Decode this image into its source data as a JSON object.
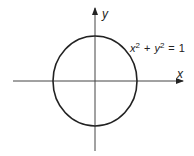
{
  "diagram": {
    "axes": {
      "x_label": "x",
      "y_label": "y"
    },
    "equation": {
      "x_var": "x",
      "x_exp": "2",
      "plus": "+",
      "y_var": "y",
      "y_exp": "2",
      "equals": "=",
      "rhs": "1",
      "full_text": "x² + y² = 1"
    },
    "circle": {
      "center": [
        0,
        0
      ],
      "radius": 1
    },
    "colors": {
      "stroke": "#222222",
      "axis": "#444444",
      "background": "#ffffff"
    }
  }
}
